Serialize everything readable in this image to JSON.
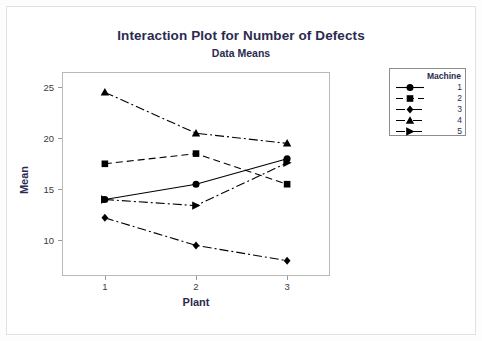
{
  "chart_data": {
    "type": "line",
    "title": "Interaction Plot for Number of Defects",
    "subtitle": "Data Means",
    "xlabel": "Plant",
    "ylabel": "Mean",
    "categories": [
      "1",
      "2",
      "3"
    ],
    "yticks": [
      "10",
      "15",
      "20",
      "25"
    ],
    "ylim": [
      6.5,
      26.5
    ],
    "grid": false,
    "legend_position": "right",
    "legend_title": "Machine",
    "series": [
      {
        "name": "1",
        "marker": "circle",
        "linestyle": "solid",
        "values": [
          14.0,
          15.5,
          18.0
        ]
      },
      {
        "name": "2",
        "marker": "square",
        "linestyle": "dashed",
        "values": [
          17.5,
          18.5,
          15.5
        ]
      },
      {
        "name": "3",
        "marker": "diamond",
        "linestyle": "dashdot",
        "values": [
          12.2,
          9.5,
          8.0
        ]
      },
      {
        "name": "4",
        "marker": "triangle-up",
        "linestyle": "dashdot",
        "values": [
          24.5,
          20.5,
          19.5
        ]
      },
      {
        "name": "5",
        "marker": "triangle-right",
        "linestyle": "dashdot",
        "values": [
          14.0,
          13.4,
          17.6
        ]
      }
    ],
    "colors": {
      "ink": "#000000",
      "title": "#2b2b4f",
      "frame": "#b9b9b9",
      "background": "#ffffff"
    }
  }
}
